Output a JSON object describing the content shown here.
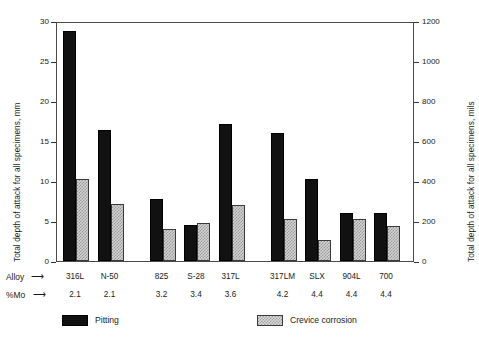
{
  "chart_data": {
    "type": "bar",
    "title": "",
    "subtitle": "",
    "xlabel": "Alloy",
    "ylabel": "Total depth of attack for all specimens, mm",
    "ylabel_secondary": "Total depth of attack for all specimens, mils",
    "categories": [
      "316L",
      "N-50",
      "825",
      "S-28",
      "317L",
      "317LM",
      "SLX",
      "904L",
      "700"
    ],
    "secondary_category_label": "%Mo",
    "secondary_categories": [
      "2.1",
      "2.1",
      "3.2",
      "3.4",
      "3.6",
      "4.2",
      "4.4",
      "4.4",
      "4.4"
    ],
    "series": [
      {
        "name": "Pitting",
        "color": "#111111",
        "values": [
          28.7,
          16.4,
          7.7,
          4.5,
          17.1,
          16.0,
          10.2,
          6.0,
          6.0
        ]
      },
      {
        "name": "Crevice corrosion",
        "color": "#d2d2d2",
        "values": [
          10.2,
          7.1,
          4.0,
          4.8,
          7.0,
          5.2,
          2.6,
          5.2,
          4.4
        ]
      }
    ],
    "ylim": [
      0,
      30
    ],
    "yticks": [
      0,
      5,
      10,
      15,
      20,
      25,
      30
    ],
    "ytick_labels": [
      "0",
      "5",
      "10",
      "15",
      "20",
      "25",
      "30"
    ],
    "ylim_secondary": [
      0,
      1200
    ],
    "yticks_secondary": [
      0,
      200,
      400,
      600,
      800,
      1000,
      1200
    ],
    "ytick_labels_secondary": [
      "0",
      "200",
      "400",
      "600",
      "800",
      "1000",
      "1200"
    ],
    "grid": false,
    "legend_position": "below",
    "group_gaps_after": [
      1,
      4
    ]
  },
  "legend": {
    "items": [
      {
        "label": "Pitting",
        "swatch": "pitting"
      },
      {
        "label": "Crevice corrosion",
        "swatch": "crevice"
      }
    ]
  },
  "axis_rows": {
    "alloy_label": "Alloy",
    "mo_label": "%Mo",
    "arrow": "⟶"
  },
  "caption": ""
}
